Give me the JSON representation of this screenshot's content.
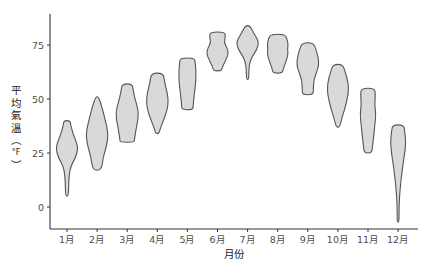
{
  "chart_data": {
    "type": "violin",
    "title": "",
    "xlabel": "月份",
    "ylabel": "平均氣溫（°F）",
    "ylabel_chars": [
      "平",
      "均",
      "氣",
      "溫",
      "︵",
      "°F",
      "︶"
    ],
    "categories": [
      "1月",
      "2月",
      "3月",
      "4月",
      "5月",
      "6月",
      "7月",
      "8月",
      "9月",
      "10月",
      "11月",
      "12月"
    ],
    "yticks": [
      0,
      25,
      50,
      75
    ],
    "ylim": [
      -10,
      90
    ],
    "grid": false,
    "legend": null,
    "fill_color": "#d9d9d9",
    "stroke_color": "#555555",
    "violins": [
      {
        "month": "1月",
        "min": 5,
        "max": 40,
        "profile": [
          [
            40,
            0.3
          ],
          [
            38,
            0.32
          ],
          [
            34,
            0.55
          ],
          [
            30,
            0.85
          ],
          [
            27,
            1.0
          ],
          [
            23,
            0.8
          ],
          [
            19,
            0.35
          ],
          [
            15,
            0.2
          ],
          [
            10,
            0.15
          ],
          [
            5,
            0.12
          ]
        ]
      },
      {
        "month": "2月",
        "min": 17,
        "max": 51,
        "profile": [
          [
            51,
            0.12
          ],
          [
            47,
            0.4
          ],
          [
            42,
            0.65
          ],
          [
            37,
            0.9
          ],
          [
            33,
            1.0
          ],
          [
            28,
            0.85
          ],
          [
            23,
            0.55
          ],
          [
            17,
            0.4
          ]
        ]
      },
      {
        "month": "3月",
        "min": 30,
        "max": 57,
        "profile": [
          [
            57,
            0.45
          ],
          [
            54,
            0.55
          ],
          [
            50,
            0.7
          ],
          [
            45,
            1.0
          ],
          [
            41,
            1.0
          ],
          [
            36,
            0.8
          ],
          [
            31,
            0.65
          ],
          [
            30,
            0.65
          ]
        ]
      },
      {
        "month": "4月",
        "min": 34,
        "max": 62,
        "profile": [
          [
            62,
            0.55
          ],
          [
            58,
            0.65
          ],
          [
            53,
            0.9
          ],
          [
            49,
            1.0
          ],
          [
            45,
            0.9
          ],
          [
            40,
            0.55
          ],
          [
            36,
            0.25
          ],
          [
            34,
            0.15
          ]
        ]
      },
      {
        "month": "5月",
        "min": 45,
        "max": 69,
        "profile": [
          [
            69,
            0.6
          ],
          [
            67,
            0.72
          ],
          [
            62,
            0.78
          ],
          [
            57,
            0.75
          ],
          [
            52,
            0.62
          ],
          [
            47,
            0.52
          ],
          [
            45,
            0.5
          ]
        ]
      },
      {
        "month": "6月",
        "min": 63,
        "max": 81,
        "profile": [
          [
            81,
            0.65
          ],
          [
            79,
            0.72
          ],
          [
            76,
            0.6
          ],
          [
            74,
            0.85
          ],
          [
            71,
            1.0
          ],
          [
            68,
            0.75
          ],
          [
            65,
            0.45
          ],
          [
            63,
            0.35
          ]
        ]
      },
      {
        "month": "7月",
        "min": 59,
        "max": 84,
        "profile": [
          [
            84,
            0.2
          ],
          [
            81,
            0.5
          ],
          [
            78,
            0.85
          ],
          [
            76,
            1.0
          ],
          [
            73,
            0.85
          ],
          [
            70,
            0.45
          ],
          [
            67,
            0.2
          ],
          [
            64,
            0.12
          ],
          [
            59,
            0.1
          ]
        ]
      },
      {
        "month": "8月",
        "min": 62,
        "max": 80,
        "profile": [
          [
            80,
            0.6
          ],
          [
            78,
            0.85
          ],
          [
            75,
            0.95
          ],
          [
            73,
            0.88
          ],
          [
            71,
            0.95
          ],
          [
            68,
            0.8
          ],
          [
            64,
            0.5
          ],
          [
            62,
            0.42
          ]
        ]
      },
      {
        "month": "9月",
        "min": 52,
        "max": 76,
        "profile": [
          [
            76,
            0.5
          ],
          [
            73,
            0.75
          ],
          [
            69,
            0.95
          ],
          [
            66,
            1.0
          ],
          [
            63,
            0.85
          ],
          [
            59,
            0.55
          ],
          [
            55,
            0.5
          ],
          [
            52,
            0.5
          ]
        ]
      },
      {
        "month": "10月",
        "min": 37,
        "max": 66,
        "profile": [
          [
            66,
            0.45
          ],
          [
            62,
            0.7
          ],
          [
            57,
            0.95
          ],
          [
            53,
            0.95
          ],
          [
            49,
            0.8
          ],
          [
            45,
            0.6
          ],
          [
            41,
            0.35
          ],
          [
            37,
            0.15
          ]
        ]
      },
      {
        "month": "11月",
        "min": 25,
        "max": 55,
        "profile": [
          [
            55,
            0.6
          ],
          [
            52,
            0.68
          ],
          [
            47,
            0.6
          ],
          [
            43,
            0.72
          ],
          [
            38,
            0.62
          ],
          [
            33,
            0.52
          ],
          [
            28,
            0.4
          ],
          [
            25,
            0.35
          ]
        ]
      },
      {
        "month": "12月",
        "min": -7,
        "max": 38,
        "profile": [
          [
            38,
            0.5
          ],
          [
            35,
            0.6
          ],
          [
            30,
            0.7
          ],
          [
            25,
            0.6
          ],
          [
            20,
            0.45
          ],
          [
            14,
            0.3
          ],
          [
            8,
            0.18
          ],
          [
            2,
            0.1
          ],
          [
            -3,
            0.08
          ],
          [
            -7,
            0.08
          ]
        ]
      }
    ]
  }
}
